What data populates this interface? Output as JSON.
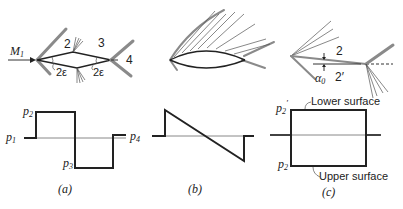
{
  "figure": {
    "panels": [
      {
        "id": "a",
        "caption": "(a)",
        "flow_label": "M",
        "flow_label_sub": "1",
        "region_labels": [
          "2",
          "3",
          "4"
        ],
        "angle_labels": [
          "2ε",
          "2ε"
        ],
        "pressure_labels": {
          "p1": {
            "base": "p",
            "sub": "1"
          },
          "p2": {
            "base": "p",
            "sub": "2"
          },
          "p3": {
            "base": "p",
            "sub": "3"
          },
          "p4": {
            "base": "p",
            "sub": "4"
          }
        }
      },
      {
        "id": "b",
        "caption": "(b)"
      },
      {
        "id": "c",
        "caption": "(c)",
        "region_labels": [
          "2",
          "2′"
        ],
        "angle_label": {
          "base": "α",
          "sub": "0"
        },
        "pressure_labels": {
          "p2prime": {
            "base": "p",
            "sub": "2",
            "prime": "′"
          },
          "p2": {
            "base": "p",
            "sub": "2"
          }
        },
        "surface_labels": {
          "lower": "Lower surface",
          "upper": "Upper surface"
        }
      }
    ]
  }
}
